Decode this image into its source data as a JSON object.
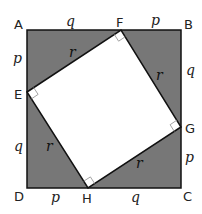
{
  "diagram": {
    "colors": {
      "outer_fill": "#777777",
      "inner_fill": "#ffffff",
      "stroke": "#111111",
      "label": "#222222"
    },
    "vertices": {
      "A": {
        "label": "A",
        "x": 27,
        "y": 30
      },
      "B": {
        "label": "B",
        "x": 181,
        "y": 30
      },
      "C": {
        "label": "C",
        "x": 181,
        "y": 188
      },
      "D": {
        "label": "D",
        "x": 27,
        "y": 188
      },
      "E": {
        "label": "E",
        "x": 27,
        "y": 92
      },
      "F": {
        "label": "F",
        "x": 121,
        "y": 30
      },
      "G": {
        "label": "G",
        "x": 181,
        "y": 127
      },
      "H": {
        "label": "H",
        "x": 88,
        "y": 188
      }
    },
    "segments": {
      "AF": "q",
      "FB": "p",
      "AE": "p",
      "ED": "q",
      "BG": "q",
      "GC": "p",
      "DH": "p",
      "HC": "q",
      "EF": "r",
      "FG": "r",
      "GH": "r",
      "HE": "r"
    },
    "right_angle_marks": [
      "E",
      "F",
      "G",
      "H"
    ]
  }
}
